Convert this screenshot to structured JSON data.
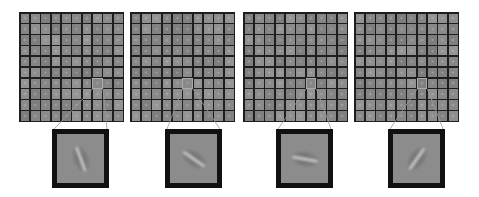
{
  "figure": {
    "panels": [
      {
        "id": "panel-1",
        "grid_left": 19,
        "inset_left": 52,
        "filter_angle_deg": -20,
        "highlight_col": 7,
        "highlight_row": 6
      },
      {
        "id": "panel-2",
        "grid_left": 130,
        "inset_left": 165,
        "filter_angle_deg": -55,
        "highlight_col": 5,
        "highlight_row": 6
      },
      {
        "id": "panel-3",
        "grid_left": 243,
        "inset_left": 276,
        "filter_angle_deg": -80,
        "highlight_col": 6,
        "highlight_row": 6
      },
      {
        "id": "panel-4",
        "grid_left": 354,
        "inset_left": 388,
        "filter_angle_deg": 35,
        "highlight_col": 6,
        "highlight_row": 6
      }
    ],
    "grid": {
      "rows": 10,
      "cols": 10
    },
    "colors": {
      "background": "#ffffff",
      "grid_lines": "#1e1e1e",
      "cell": "#8a8a8a",
      "inset_border": "#111111",
      "connector": "#9a9a9a"
    }
  }
}
